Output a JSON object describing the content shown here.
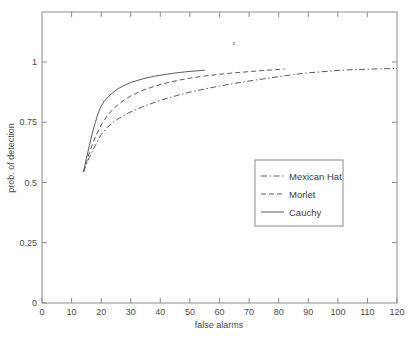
{
  "figure": {
    "background_color": "#ffffff",
    "axis_color": "#8c8c8c",
    "curve_color": "#5a5a5a",
    "text_color": "#4a4a4a"
  },
  "axes": {
    "xlabel": "false alarms",
    "ylabel": "prob. of detection",
    "x_ticks": [
      "0",
      "10",
      "20",
      "30",
      "40",
      "50",
      "60",
      "70",
      "80",
      "90",
      "100",
      "110",
      "120"
    ],
    "y_ticks": [
      "0",
      "0.25",
      "0.5",
      "0.75",
      "1"
    ],
    "xlim": [
      0,
      120
    ],
    "ylim": [
      0,
      1.21
    ]
  },
  "legend": {
    "position": "center-right",
    "entries": [
      {
        "label": "Mexican Hat",
        "style": "dashdot"
      },
      {
        "label": "Morlet",
        "style": "dashed"
      },
      {
        "label": "Cauchy",
        "style": "solid"
      }
    ]
  },
  "chart_data": {
    "type": "line",
    "title": "",
    "xlabel": "false alarms",
    "ylabel": "prob. of detection",
    "xlim": [
      0,
      120
    ],
    "ylim": [
      0,
      1.21
    ],
    "grid": false,
    "legend_position": "center-right",
    "series": [
      {
        "name": "Mexican Hat",
        "style": "dashdot",
        "x": [
          14,
          16,
          18,
          20,
          22,
          24,
          26,
          28,
          30,
          34,
          38,
          42,
          46,
          50,
          55,
          60,
          65,
          70,
          75,
          80,
          85,
          90,
          95,
          100,
          105,
          110,
          115,
          120
        ],
        "y": [
          0.545,
          0.605,
          0.655,
          0.7,
          0.73,
          0.752,
          0.768,
          0.782,
          0.795,
          0.816,
          0.834,
          0.85,
          0.864,
          0.877,
          0.89,
          0.902,
          0.913,
          0.923,
          0.932,
          0.941,
          0.95,
          0.957,
          0.962,
          0.967,
          0.97,
          0.972,
          0.974,
          0.975
        ]
      },
      {
        "name": "Morlet",
        "style": "dashed",
        "x": [
          14,
          16,
          18,
          20,
          22,
          24,
          26,
          28,
          30,
          34,
          38,
          42,
          46,
          50,
          55,
          60,
          65,
          70,
          75,
          80,
          82
        ],
        "y": [
          0.545,
          0.625,
          0.69,
          0.74,
          0.778,
          0.806,
          0.828,
          0.846,
          0.861,
          0.884,
          0.901,
          0.915,
          0.926,
          0.935,
          0.944,
          0.951,
          0.957,
          0.962,
          0.967,
          0.971,
          0.973
        ]
      },
      {
        "name": "Cauchy",
        "style": "solid",
        "x": [
          14,
          15,
          16,
          17,
          18,
          19,
          20,
          21,
          22,
          24,
          26,
          28,
          30,
          34,
          38,
          42,
          46,
          50,
          53,
          55
        ],
        "y": [
          0.545,
          0.6,
          0.655,
          0.705,
          0.75,
          0.79,
          0.818,
          0.838,
          0.853,
          0.876,
          0.893,
          0.906,
          0.917,
          0.932,
          0.943,
          0.951,
          0.958,
          0.963,
          0.966,
          0.968
        ]
      }
    ]
  }
}
